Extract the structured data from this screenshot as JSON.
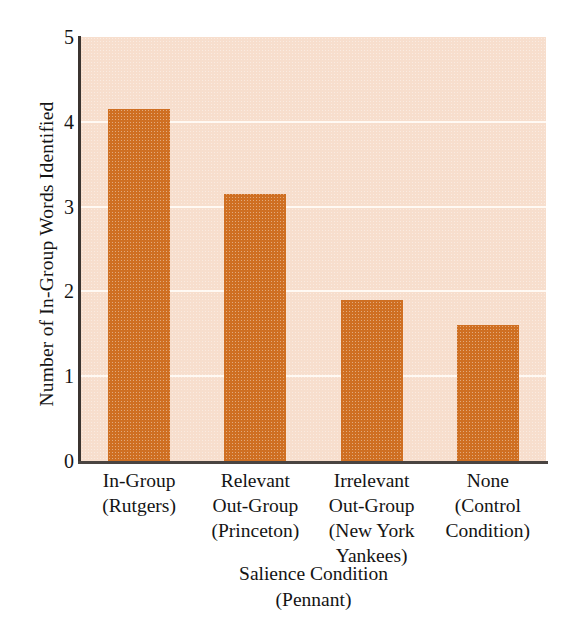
{
  "chart_data": {
    "type": "bar",
    "title": "",
    "xlabel": "Salience Condition\n(Pennant)",
    "xlabel_lines": [
      "Salience Condition",
      "(Pennant)"
    ],
    "ylabel": "Number of In-Group Words Identified",
    "categories": [
      "In-Group (Rutgers)",
      "Relevant Out-Group (Princeton)",
      "Irrelevant Out-Group (New York Yankees)",
      "None (Control Condition)"
    ],
    "category_lines": [
      [
        "In-Group",
        "(Rutgers)"
      ],
      [
        "Relevant",
        "Out-Group",
        "(Princeton)"
      ],
      [
        "Irrelevant",
        "Out-Group",
        "(New York",
        "Yankees)"
      ],
      [
        "None",
        "(Control",
        "Condition)"
      ]
    ],
    "values": [
      4.15,
      3.15,
      1.9,
      1.6
    ],
    "ylim": [
      0,
      5
    ],
    "ytick_labels": [
      "5",
      "4",
      "3",
      "2",
      "1",
      "0"
    ],
    "ytick_values": [
      5,
      4,
      3,
      2,
      1,
      0
    ],
    "gridlines": [
      4,
      3,
      2,
      1
    ],
    "grid": true,
    "legend": "none",
    "colors": {
      "bar": "#cf6f22",
      "plot_background": "#f7decd",
      "gridline": "#fffbf6",
      "axis": "#3b3430",
      "text": "#141414",
      "page_background": "#ffffff"
    }
  }
}
